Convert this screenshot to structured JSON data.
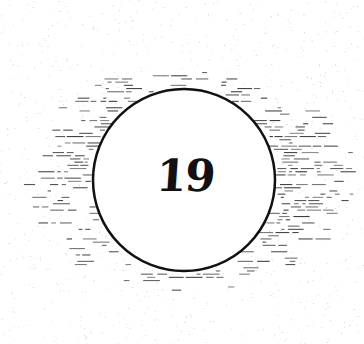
{
  "artwork": {
    "number_label": "19",
    "colors": {
      "background": "#ffffff",
      "ink": "#111111",
      "dash_ink": "#333333",
      "speckle": "#9a9a9a"
    },
    "circle": {
      "cx": 184,
      "cy": 180,
      "r": 91,
      "stroke_width": 2.5
    },
    "halo": {
      "cx": 190,
      "cy": 178,
      "rx": 165,
      "ry": 115
    }
  }
}
